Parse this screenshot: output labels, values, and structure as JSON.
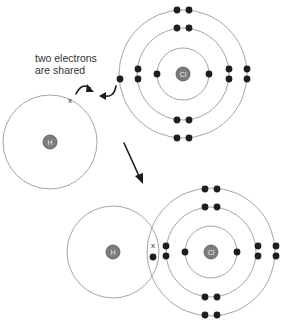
{
  "caption": {
    "line1": "two electrons",
    "line2": "are shared"
  },
  "before": {
    "hydrogen": {
      "label": "H",
      "cx": 50,
      "cy": 142,
      "shell_radius": 47,
      "electron_marker": "x",
      "electron_pos": [
        70,
        100
      ]
    },
    "chlorine": {
      "label": "Cl",
      "cx": 183,
      "cy": 74,
      "shell_radii": [
        26,
        46,
        64
      ],
      "electrons_per_shell": [
        2,
        8,
        7
      ]
    }
  },
  "after": {
    "hydrogen": {
      "label": "H",
      "cx": 113,
      "cy": 252,
      "shell_radius": 46,
      "electron_marker": "x"
    },
    "chlorine": {
      "label": "Cl",
      "cx": 211,
      "cy": 252,
      "shell_radii": [
        26,
        45,
        64
      ],
      "electrons_per_shell": [
        2,
        8,
        8
      ]
    }
  },
  "colors": {
    "shell": "#9a9a9a",
    "electron": "#1e1e1e",
    "nucleus": "#7d7d7d",
    "text": "#333333"
  },
  "icons": {
    "curved_arrow_1": "curved-arrow-icon",
    "curved_arrow_2": "curved-arrow-icon",
    "reaction_arrow": "arrow-down-right-icon"
  }
}
